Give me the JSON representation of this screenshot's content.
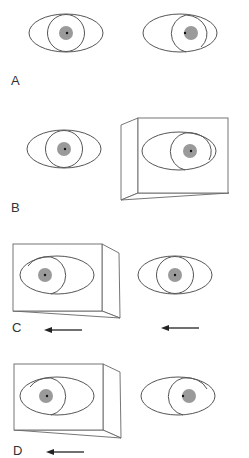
{
  "figure": {
    "panels": [
      {
        "id": "A",
        "label": "A",
        "description": "Both eyes without occluder; right eye deviated (pupil/light reflex displaced)"
      },
      {
        "id": "B",
        "label": "B",
        "description": "Cover placed over right eye; left eye fixating centrally"
      },
      {
        "id": "C",
        "label": "C",
        "description": "Cover over left eye; arrows indicate leftward movement of both eyes"
      },
      {
        "id": "D",
        "label": "D",
        "description": "Cover over left eye; arrow indicates leftward movement; uncovered eye deviated"
      }
    ],
    "colors": {
      "outline": "#555555",
      "iris": "#9a9a9a",
      "pupil": "#111111",
      "background": "#ffffff"
    }
  }
}
